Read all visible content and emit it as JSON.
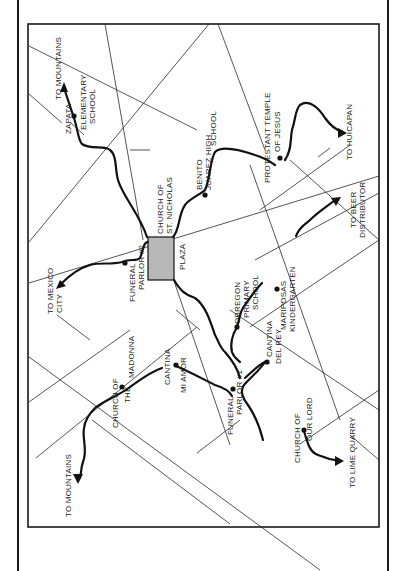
{
  "map": {
    "orientation": "rotated-90-ccw",
    "plaza_fill": "#b8b8b8",
    "ink_color": "#1a1a1a",
    "labels": {
      "to_mountains_north": "TO MOUNTAINS",
      "zapata_school_1": "ZAPATA",
      "zapata_school_2": "ELEMENTARY",
      "zapata_school_3": "SCHOOL",
      "church_st_nicholas_1": "CHURCH OF",
      "church_st_nicholas_2": "ST. NICHOLAS",
      "benito_juarez_1": "BENITO",
      "benito_juarez_2": "JUAREZ HIGH",
      "benito_juarez_3": "SCHOOL",
      "protestant_temple_1": "PROTESTANT TEMPLE",
      "protestant_temple_2": "OF JESUS",
      "to_huicapan": "TO HUICAPAN",
      "funeral_parlor_2_1": "FUNERAL",
      "funeral_parlor_2_2": "PARLOR #2",
      "to_mexico_city_1": "TO MEXICO",
      "to_mexico_city_2": "CITY",
      "plaza": "PLAZA",
      "obregon_1": "OBREGON",
      "obregon_2": "PRIMARY",
      "obregon_3": "SCHOOL",
      "mariposas_1": "MARIPOSAS",
      "mariposas_2": "KINDERGARTEN",
      "to_beer_1": "TO BEER",
      "to_beer_2": "DISTRIBUTOR",
      "church_madonna_1": "CHURCH OF",
      "church_madonna_2": "THE",
      "church_madonna_3": "MADONNA",
      "cantina_mi_amor_1": "CANTINA",
      "cantina_mi_amor_2": "MI    AMOR",
      "funeral_parlor_1_1": "FUNERAL",
      "funeral_parlor_1_2": "PARLOR #1",
      "cantina_del_rey_1": "CANTINA",
      "cantina_del_rey_2": "DEL REY",
      "church_our_lord_1": "CHURCH OF",
      "church_our_lord_2": "OUR LORD",
      "to_lime_quarry": "TO LIME QUARRY",
      "to_mountains_south": "TO MOUNTAINS"
    }
  }
}
